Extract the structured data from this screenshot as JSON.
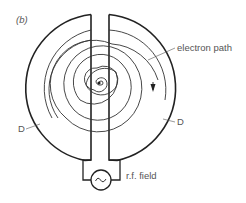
{
  "figure": {
    "panel_label": "(b)",
    "labels": {
      "electron_path": "electron path",
      "dee_left": "D",
      "dee_right": "D",
      "rf_field": "r.f. field"
    },
    "source_symbol": "~"
  },
  "colors": {
    "stroke": "#222222",
    "thin_stroke": "#444444",
    "text": "#555555",
    "background": "#ffffff"
  }
}
